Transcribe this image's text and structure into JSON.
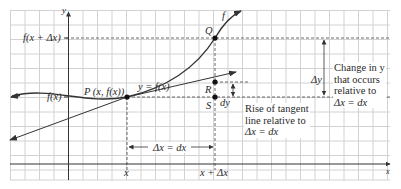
{
  "figure": {
    "axes": {
      "x_label": "x",
      "y_label": "y"
    },
    "curve_label": "f",
    "equation_label": "y = f(x)",
    "y_ticks": {
      "upper": "f(x + Δx)",
      "lower": "f(x)"
    },
    "x_ticks": {
      "left": "x",
      "right": "x + Δx"
    },
    "points": {
      "P": "P (x, f(x))",
      "Q": "Q",
      "R": "R",
      "S": "S"
    },
    "dx_label": "Δx = dx",
    "dy_label": "dy",
    "delta_y_label": "Δy",
    "change_note": [
      "Change in y",
      "that occurs",
      "relative to",
      "Δx = dx"
    ],
    "rise_note": [
      "Rise of tangent",
      "line relative to",
      "Δx = dx"
    ],
    "colors": {
      "grid": "#d2d2d2",
      "axis": "#333333",
      "curve": "#333333",
      "dashed": "#444444",
      "background": "#ffffff"
    }
  }
}
